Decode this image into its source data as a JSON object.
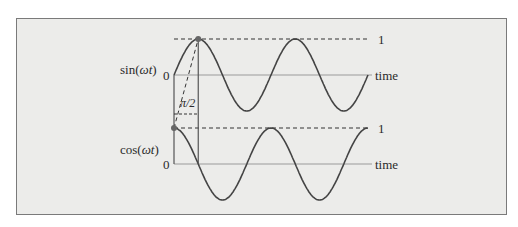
{
  "figure": {
    "background": "#ececea",
    "border_color": "#7a7a7a",
    "curve_color": "#444444",
    "axis_color": "#9a9a9a"
  },
  "top_plot": {
    "ylabel_prefix": "sin(",
    "ylabel_var": "ωt",
    "ylabel_suffix": ")",
    "zero_label": "0",
    "one_label": "1",
    "xlabel": "time"
  },
  "bottom_plot": {
    "ylabel_prefix": "cos(",
    "ylabel_var": "ωt",
    "ylabel_suffix": ")",
    "zero_label": "0",
    "one_label": "1",
    "xlabel": "time"
  },
  "annotation": {
    "phase_label": "π/2"
  },
  "chart_data": [
    {
      "type": "line",
      "title": "",
      "ylabel": "sin(ωt)",
      "xlabel": "time",
      "series": [
        {
          "name": "sin(ωt)",
          "function": "sin",
          "cycles": 2.0
        }
      ],
      "y_ticks": [
        "0",
        "1"
      ],
      "ylim": [
        -1,
        1
      ],
      "grid": false
    },
    {
      "type": "line",
      "title": "",
      "ylabel": "cos(ωt)",
      "xlabel": "time",
      "series": [
        {
          "name": "cos(ωt)",
          "function": "cos",
          "cycles": 2.0
        }
      ],
      "y_ticks": [
        "0",
        "1"
      ],
      "ylim": [
        -1,
        1
      ],
      "grid": false
    }
  ]
}
